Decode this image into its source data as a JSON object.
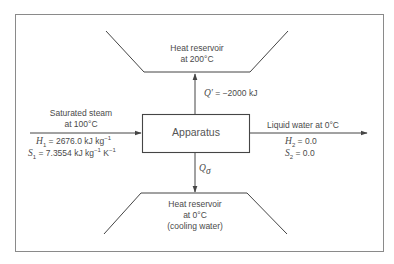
{
  "colors": {
    "line": "#454545",
    "text": "#4a4a4a",
    "frame": "#8a8a8a",
    "background": "#ffffff"
  },
  "hot_reservoir": {
    "line1": "Heat reservoir",
    "line2": "at 200°C"
  },
  "cold_reservoir": {
    "line1": "Heat reservoir",
    "line2": "at 0°C",
    "line3": "(cooling water)"
  },
  "apparatus": {
    "label": "Apparatus"
  },
  "heat_to_hot": {
    "symbol": "Q′",
    "equals": "= −2000 kJ"
  },
  "heat_to_cold": {
    "symbol": "Q",
    "subscript": "σ"
  },
  "inlet": {
    "line1": "Saturated steam",
    "line2": "at 100°C",
    "H_symbol": "H",
    "H_sub": "1",
    "H_value": "= 2676.0 kJ kg",
    "H_unit_sup": "−1",
    "S_symbol": "S",
    "S_sub": "1",
    "S_value": "= 7.3554 kJ kg",
    "S_unit_sup1": "−1",
    "S_unit_K": " K",
    "S_unit_sup2": "−1"
  },
  "outlet": {
    "line1": "Liquid water at 0°C",
    "H_symbol": "H",
    "H_sub": "2",
    "H_value": "= 0.0",
    "S_symbol": "S",
    "S_sub": "2",
    "S_value": "= 0.0"
  }
}
